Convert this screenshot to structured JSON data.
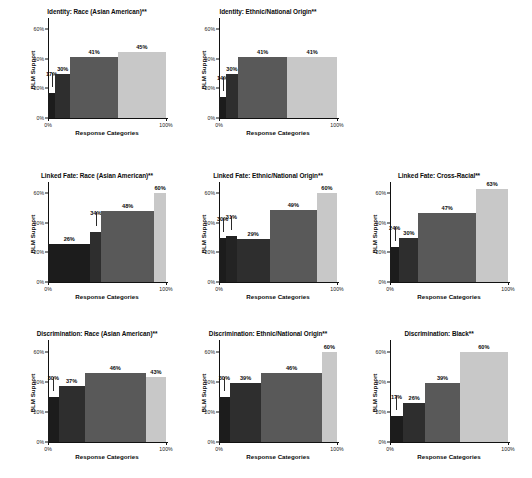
{
  "figure": {
    "axis": {
      "ylabel": "BLM Support",
      "xlabel": "Response Categories",
      "yticks": [
        "0%",
        "20%",
        "40%",
        "60%"
      ],
      "ytick_values": [
        0,
        20,
        40,
        60
      ],
      "xticks": [
        "0%",
        "100%"
      ],
      "ylim": [
        0,
        65
      ],
      "xlim": [
        0,
        100
      ]
    },
    "colors": {
      "bar_1": "#1c1c1c",
      "bar_2": "#2e2e2e",
      "bar_3": "#595959",
      "bar_4": "#c8c8c8",
      "axis": "#111111",
      "background": "#ffffff"
    }
  },
  "chart_data": [
    {
      "type": "bar",
      "title": "Identity: Race (Asian American)**",
      "xlabel": "Response Categories",
      "ylabel": "BLM Support",
      "ylim": [
        0,
        65
      ],
      "grid": false,
      "categories": [
        "1",
        "2",
        "3",
        "4"
      ],
      "values": [
        17,
        30,
        41,
        45
      ],
      "labels": [
        "17%",
        "30%",
        "41%",
        "45%"
      ],
      "widths": [
        6,
        13,
        40,
        41
      ],
      "colors": [
        "#1c1c1c",
        "#2e2e2e",
        "#595959",
        "#c8c8c8"
      ],
      "leader": [
        true,
        false,
        false,
        false
      ]
    },
    {
      "type": "bar",
      "title": "Identity: Ethnic/National Origin**",
      "xlabel": "Response Categories",
      "ylabel": "BLM Support",
      "ylim": [
        0,
        65
      ],
      "grid": false,
      "categories": [
        "1",
        "2",
        "3",
        "4"
      ],
      "values": [
        14,
        30,
        41,
        41
      ],
      "labels": [
        "14%",
        "30%",
        "41%",
        "41%"
      ],
      "widths": [
        6,
        10,
        42,
        42
      ],
      "colors": [
        "#1c1c1c",
        "#2e2e2e",
        "#595959",
        "#c8c8c8"
      ],
      "leader": [
        true,
        false,
        false,
        false
      ]
    },
    {
      "type": "bar",
      "title": "Linked Fate: Race (Asian American)**",
      "xlabel": "Response Categories",
      "ylabel": "BLM Support",
      "ylim": [
        0,
        65
      ],
      "grid": false,
      "categories": [
        "1",
        "2",
        "3",
        "4"
      ],
      "values": [
        26,
        34,
        48,
        60
      ],
      "labels": [
        "26%",
        "34%",
        "48%",
        "60%"
      ],
      "widths": [
        36,
        9,
        45,
        10
      ],
      "colors": [
        "#1c1c1c",
        "#2e2e2e",
        "#595959",
        "#c8c8c8"
      ],
      "leader": [
        false,
        true,
        false,
        false
      ]
    },
    {
      "type": "bar",
      "title": "Linked Fate: Ethnic/National Origin**",
      "xlabel": "Response Categories",
      "ylabel": "BLM Support",
      "ylim": [
        0,
        65
      ],
      "grid": false,
      "categories": [
        "1",
        "2",
        "3",
        "4"
      ],
      "values": [
        30,
        31,
        29,
        49,
        60
      ],
      "labels": [
        "30%",
        "31%",
        "29%",
        "49%",
        "60%"
      ],
      "widths": [
        6,
        9,
        28,
        40,
        17
      ],
      "colors": [
        "#1c1c1c",
        "#232323",
        "#2e2e2e",
        "#595959",
        "#c8c8c8"
      ],
      "leader": [
        true,
        true,
        false,
        false,
        false
      ]
    },
    {
      "type": "bar",
      "title": "Linked Fate: Cross-Racial**",
      "xlabel": "Response Categories",
      "ylabel": "BLM Support",
      "ylim": [
        0,
        65
      ],
      "grid": false,
      "categories": [
        "1",
        "2",
        "3",
        "4"
      ],
      "values": [
        24,
        30,
        47,
        63
      ],
      "labels": [
        "24%",
        "30%",
        "47%",
        "63%"
      ],
      "widths": [
        8,
        16,
        49,
        27
      ],
      "colors": [
        "#1c1c1c",
        "#2e2e2e",
        "#595959",
        "#c8c8c8"
      ],
      "leader": [
        true,
        false,
        false,
        false
      ]
    },
    {
      "type": "bar",
      "title": "Discrimination: Race (Asian American)**",
      "xlabel": "Response Categories",
      "ylabel": "BLM Support",
      "ylim": [
        0,
        65
      ],
      "grid": false,
      "categories": [
        "1",
        "2",
        "3",
        "4"
      ],
      "values": [
        30,
        37,
        46,
        43
      ],
      "labels": [
        "30%",
        "37%",
        "46%",
        "43%"
      ],
      "widths": [
        9,
        22,
        52,
        17
      ],
      "colors": [
        "#1c1c1c",
        "#2e2e2e",
        "#595959",
        "#c8c8c8"
      ],
      "leader": [
        true,
        false,
        false,
        false
      ]
    },
    {
      "type": "bar",
      "title": "Discrimination: Ethnic/National Origin**",
      "xlabel": "Response Categories",
      "ylabel": "BLM Support",
      "ylim": [
        0,
        65
      ],
      "grid": false,
      "categories": [
        "1",
        "2",
        "3",
        "4"
      ],
      "values": [
        30,
        39,
        46,
        60
      ],
      "labels": [
        "30%",
        "39%",
        "46%",
        "60%"
      ],
      "widths": [
        9,
        27,
        51,
        13
      ],
      "colors": [
        "#1c1c1c",
        "#2e2e2e",
        "#595959",
        "#c8c8c8"
      ],
      "leader": [
        true,
        false,
        false,
        false
      ]
    },
    {
      "type": "bar",
      "title": "Discrimination: Black**",
      "xlabel": "Response Categories",
      "ylabel": "BLM Support",
      "ylim": [
        0,
        65
      ],
      "grid": false,
      "categories": [
        "1",
        "2",
        "3",
        "4"
      ],
      "values": [
        17,
        26,
        39,
        60
      ],
      "labels": [
        "17%",
        "26%",
        "39%",
        "60%"
      ],
      "widths": [
        11,
        19,
        29,
        41
      ],
      "colors": [
        "#1c1c1c",
        "#2e2e2e",
        "#595959",
        "#c8c8c8"
      ],
      "leader": [
        true,
        false,
        false,
        false
      ]
    }
  ],
  "layout": {
    "panels": [
      {
        "index": 0,
        "left": 22,
        "top": 8,
        "width": 150,
        "height": 132
      },
      {
        "index": 1,
        "left": 193,
        "top": 8,
        "width": 150,
        "height": 132
      },
      {
        "index": 2,
        "left": 22,
        "top": 172,
        "width": 150,
        "height": 132
      },
      {
        "index": 3,
        "left": 193,
        "top": 172,
        "width": 150,
        "height": 132
      },
      {
        "index": 4,
        "left": 364,
        "top": 172,
        "width": 150,
        "height": 132
      },
      {
        "index": 5,
        "left": 22,
        "top": 330,
        "width": 150,
        "height": 134
      },
      {
        "index": 6,
        "left": 193,
        "top": 330,
        "width": 150,
        "height": 134
      },
      {
        "index": 7,
        "left": 364,
        "top": 330,
        "width": 150,
        "height": 134
      }
    ]
  }
}
